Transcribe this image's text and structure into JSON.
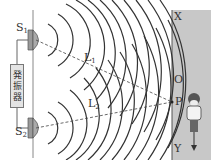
{
  "labels": {
    "s1": "S",
    "s1_sub": "1",
    "s2": "S",
    "s2_sub": "2",
    "l1": "L",
    "l1_sub": "1",
    "l2": "L",
    "l2_sub": "2",
    "x": "X",
    "o": "O",
    "p": "P",
    "y": "Y"
  },
  "oscillator": {
    "chars": [
      "発",
      "振",
      "器"
    ]
  },
  "colors": {
    "wall": "#c8c8c8",
    "line": "#333333",
    "background": "#ffffff"
  }
}
